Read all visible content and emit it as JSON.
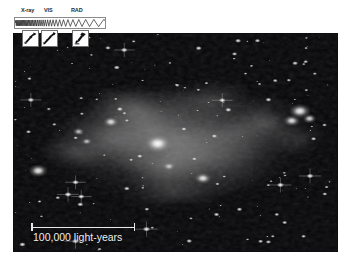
{
  "image": {
    "subject": "colliding galaxies",
    "rendering": "grayscale astronomical image",
    "background_color": "#050506",
    "frame_border_color": "#0d0d10"
  },
  "spectrum_banner": {
    "name": "electromagnetic-spectrum-banner",
    "bands": [
      {
        "id": "xray",
        "label": "X-ray"
      },
      {
        "id": "vis",
        "label": "VIS"
      },
      {
        "id": "rad",
        "label": "RAD"
      }
    ],
    "observatories": [
      {
        "id": "obs-xray",
        "icon": "x-ray-telescope-icon"
      },
      {
        "id": "obs-optical",
        "icon": "optical-telescope-icon"
      },
      {
        "id": "obs-radio",
        "icon": "radio-telescope-icon"
      }
    ]
  },
  "scale_bar": {
    "name": "scale-bar",
    "label": "100,000 light-years",
    "value": 100000,
    "unit": "light-years",
    "bar_length_px": 104,
    "color": "#e8e8e8"
  },
  "chart_data": {
    "type": "heatmap",
    "title": "",
    "xlabel": "",
    "ylabel": "",
    "colormap": "grayscale",
    "nebula_blobs": [
      {
        "cx": 50,
        "cy": 50,
        "rx": 40,
        "ry": 26,
        "intensity": 0.42
      },
      {
        "cx": 42,
        "cy": 42,
        "rx": 26,
        "ry": 19,
        "intensity": 0.5
      },
      {
        "cx": 58,
        "cy": 58,
        "rx": 24,
        "ry": 17,
        "intensity": 0.45
      },
      {
        "cx": 30,
        "cy": 48,
        "rx": 18,
        "ry": 16,
        "intensity": 0.4
      },
      {
        "cx": 68,
        "cy": 45,
        "rx": 20,
        "ry": 15,
        "intensity": 0.38
      },
      {
        "cx": 46,
        "cy": 60,
        "rx": 14,
        "ry": 12,
        "intensity": 0.44
      },
      {
        "cx": 36,
        "cy": 35,
        "rx": 14,
        "ry": 10,
        "intensity": 0.46
      },
      {
        "cx": 78,
        "cy": 40,
        "rx": 13,
        "ry": 12,
        "intensity": 0.4
      },
      {
        "cx": 20,
        "cy": 55,
        "rx": 12,
        "ry": 10,
        "intensity": 0.34
      },
      {
        "cx": 60,
        "cy": 30,
        "rx": 16,
        "ry": 10,
        "intensity": 0.36
      },
      {
        "cx": 50,
        "cy": 72,
        "rx": 18,
        "ry": 10,
        "intensity": 0.32
      },
      {
        "cx": 88,
        "cy": 48,
        "rx": 10,
        "ry": 9,
        "intensity": 0.3
      }
    ],
    "bright_knots": [
      {
        "cx": 44.5,
        "cy": 50.5,
        "r": 4.2,
        "intensity": 1.0
      },
      {
        "cx": 88.5,
        "cy": 35.5,
        "r": 3.4,
        "intensity": 0.95
      },
      {
        "cx": 86.0,
        "cy": 40.0,
        "r": 2.6,
        "intensity": 0.88
      },
      {
        "cx": 91.5,
        "cy": 39.0,
        "r": 2.2,
        "intensity": 0.82
      },
      {
        "cx": 7.5,
        "cy": 63.0,
        "r": 3.0,
        "intensity": 0.92
      },
      {
        "cx": 30.0,
        "cy": 40.5,
        "r": 2.4,
        "intensity": 0.85
      },
      {
        "cx": 58.5,
        "cy": 66.5,
        "r": 2.6,
        "intensity": 0.9
      },
      {
        "cx": 20.0,
        "cy": 45.0,
        "r": 1.8,
        "intensity": 0.7
      },
      {
        "cx": 22.5,
        "cy": 49.5,
        "r": 1.6,
        "intensity": 0.68
      },
      {
        "cx": 48.0,
        "cy": 61.0,
        "r": 1.9,
        "intensity": 0.66
      }
    ],
    "star_count": 190
  }
}
